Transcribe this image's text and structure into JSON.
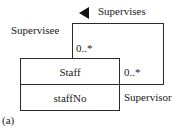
{
  "diagram": {
    "type": "uml-class-recursive-association",
    "class": {
      "name": "Staff",
      "attributes": [
        "staffNo"
      ]
    },
    "association": {
      "name": "Supervises",
      "direction_indicator": "left-triangle",
      "roles": {
        "source_role": "Supervisee",
        "target_role": "Supervisor"
      },
      "multiplicities": {
        "supervisee_end": "0..*",
        "supervisor_end": "0..*"
      }
    },
    "caption": "(a)"
  }
}
